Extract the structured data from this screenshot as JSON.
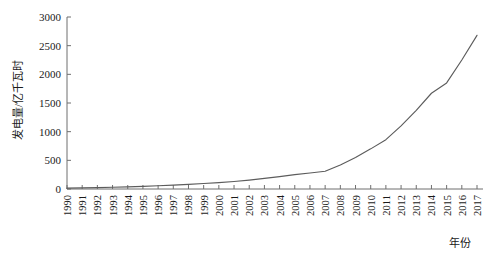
{
  "figure": {
    "clipped_top_text": "",
    "background": "#ffffff",
    "line_color": "#5c5c5c",
    "axis_color": "#6f6f6f"
  },
  "chart_data": {
    "type": "line",
    "title": "",
    "xlabel": "年份",
    "ylabel": "发电量/亿千瓦时",
    "xlim": [
      1990,
      2017
    ],
    "ylim": [
      0,
      3000
    ],
    "yticks": [
      0,
      500,
      1000,
      1500,
      2000,
      2500,
      3000
    ],
    "ytick_labels": [
      "0",
      "500",
      "1000",
      "1500",
      "2000",
      "2500",
      "3000"
    ],
    "grid": false,
    "legend": null,
    "categories": [
      "1990",
      "1991",
      "1992",
      "1993",
      "1994",
      "1995",
      "1996",
      "1997",
      "1998",
      "1999",
      "2000",
      "2001",
      "2002",
      "2003",
      "2004",
      "2005",
      "2006",
      "2007",
      "2008",
      "2009",
      "2010",
      "2011",
      "2012",
      "2013",
      "2014",
      "2015",
      "2016",
      "2017"
    ],
    "x": [
      1990,
      1991,
      1992,
      1993,
      1994,
      1995,
      1996,
      1997,
      1998,
      1999,
      2000,
      2001,
      2002,
      2003,
      2004,
      2005,
      2006,
      2007,
      2008,
      2009,
      2010,
      2011,
      2012,
      2013,
      2014,
      2015,
      2016,
      2017
    ],
    "series": [
      {
        "name": "发电量",
        "values": [
          15,
          20,
          25,
          30,
          38,
          47,
          57,
          68,
          80,
          95,
          110,
          130,
          155,
          185,
          215,
          250,
          280,
          310,
          420,
          550,
          700,
          860,
          1100,
          1370,
          1670,
          1850,
          2250,
          2680
        ]
      }
    ]
  }
}
